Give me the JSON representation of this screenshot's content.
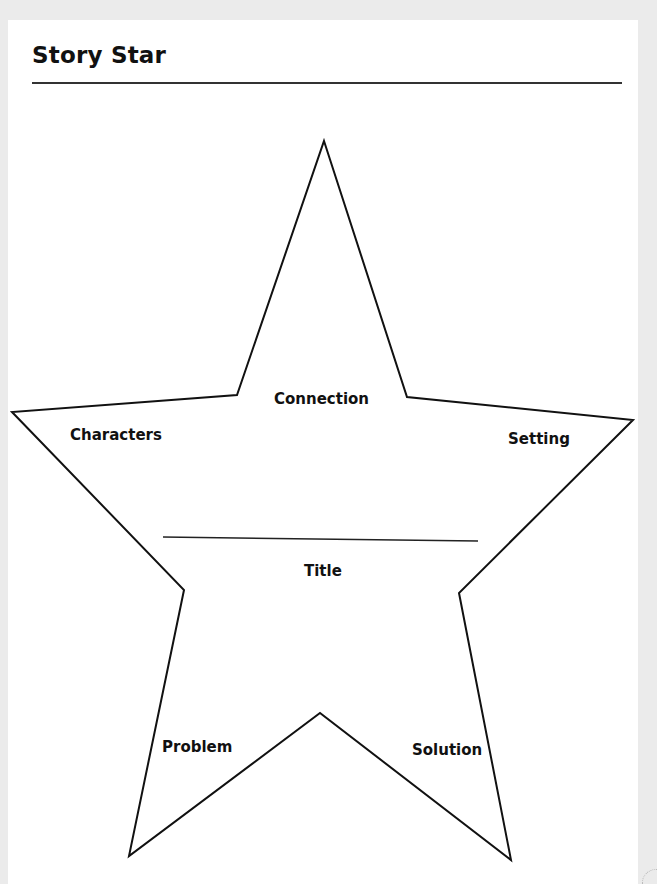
{
  "page": {
    "title": "Story Star",
    "background_color": "#ebebeb",
    "paper_color": "#ffffff"
  },
  "star": {
    "points": "324,141 407,397 633,420 459,593 511,860 320,713 129,856 184,590 12,412 237,395",
    "stroke_color": "#111111",
    "title_line": {
      "x1": 163,
      "y1": 537,
      "x2": 478,
      "y2": 541
    }
  },
  "labels": {
    "connection": "Connection",
    "characters": "Characters",
    "setting": "Setting",
    "title": "Title",
    "problem": "Problem",
    "solution": "Solution"
  }
}
